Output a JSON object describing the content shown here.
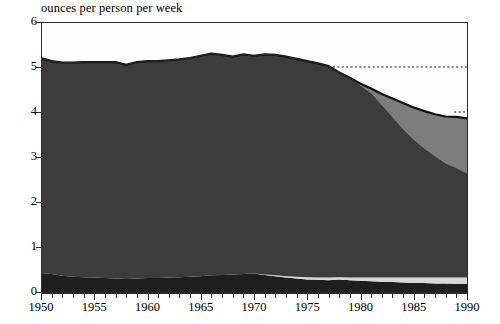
{
  "chart": {
    "title": "ounces per person per week",
    "axis_title_y": "ounces per person per week"
  },
  "axes": {
    "y_labels": [
      "6",
      "5",
      "4",
      "3",
      "2",
      "1",
      "0"
    ],
    "x_labels": [
      "1950",
      "1955",
      "1960",
      "1965",
      "1970",
      "1975",
      "1980",
      "1985",
      "1990"
    ]
  },
  "colors": {
    "series_bottom": "#1e1e1e",
    "series_thin_light": "#d8d8d8",
    "series_main": "#3c3c3c",
    "series_wedge": "#7d7d7d",
    "background": "#fdfdfd",
    "axis": "#2b2b2b",
    "outline": "#111111"
  },
  "chart_data": {
    "type": "area",
    "title": "ounces per person per week",
    "xlabel": "",
    "ylabel": "ounces per person per week",
    "xlim": [
      1950,
      1990
    ],
    "ylim": [
      0,
      6
    ],
    "grid": false,
    "legend": "none",
    "stacked": true,
    "x": [
      1950,
      1951,
      1952,
      1953,
      1954,
      1955,
      1956,
      1957,
      1958,
      1959,
      1960,
      1961,
      1962,
      1963,
      1964,
      1965,
      1966,
      1967,
      1968,
      1969,
      1970,
      1971,
      1972,
      1973,
      1974,
      1975,
      1976,
      1977,
      1978,
      1979,
      1980,
      1981,
      1982,
      1983,
      1984,
      1985,
      1986,
      1987,
      1988,
      1989,
      1990
    ],
    "series": [
      {
        "name": "bottom-dark-band",
        "values": [
          0.42,
          0.4,
          0.36,
          0.34,
          0.33,
          0.32,
          0.31,
          0.3,
          0.29,
          0.3,
          0.31,
          0.31,
          0.32,
          0.33,
          0.34,
          0.35,
          0.37,
          0.38,
          0.39,
          0.4,
          0.41,
          0.38,
          0.35,
          0.32,
          0.3,
          0.28,
          0.27,
          0.26,
          0.28,
          0.26,
          0.25,
          0.24,
          0.23,
          0.22,
          0.21,
          0.2,
          0.2,
          0.19,
          0.19,
          0.18,
          0.18
        ]
      },
      {
        "name": "thin-light-band",
        "values": [
          0.0,
          0.0,
          0.0,
          0.0,
          0.0,
          0.0,
          0.0,
          0.0,
          0.0,
          0.0,
          0.0,
          0.0,
          0.0,
          0.0,
          0.0,
          0.0,
          0.0,
          0.0,
          0.0,
          0.0,
          0.0,
          0.01,
          0.02,
          0.03,
          0.04,
          0.05,
          0.05,
          0.06,
          0.05,
          0.06,
          0.07,
          0.08,
          0.09,
          0.1,
          0.11,
          0.12,
          0.12,
          0.13,
          0.13,
          0.14,
          0.14
        ]
      },
      {
        "name": "main-dark-area",
        "values": [
          4.78,
          4.73,
          4.74,
          4.76,
          4.78,
          4.79,
          4.8,
          4.81,
          4.76,
          4.81,
          4.82,
          4.82,
          4.83,
          4.84,
          4.86,
          4.9,
          4.93,
          4.89,
          4.84,
          4.88,
          4.84,
          4.89,
          4.9,
          4.88,
          4.84,
          4.8,
          4.76,
          4.7,
          4.55,
          4.42,
          4.25,
          4.08,
          3.82,
          3.55,
          3.28,
          3.05,
          2.85,
          2.68,
          2.52,
          2.42,
          2.3
        ]
      },
      {
        "name": "grey-wedge",
        "values": [
          0.0,
          0.0,
          0.0,
          0.0,
          0.0,
          0.0,
          0.0,
          0.0,
          0.0,
          0.0,
          0.0,
          0.0,
          0.0,
          0.0,
          0.0,
          0.0,
          0.0,
          0.0,
          0.0,
          0.0,
          0.0,
          0.0,
          0.0,
          0.0,
          0.0,
          0.0,
          0.0,
          0.0,
          0.0,
          0.02,
          0.06,
          0.12,
          0.26,
          0.43,
          0.6,
          0.73,
          0.85,
          0.95,
          1.06,
          1.15,
          1.24
        ]
      }
    ],
    "series_totals": [
      5.2,
      5.13,
      5.1,
      5.1,
      5.11,
      5.11,
      5.11,
      5.11,
      5.05,
      5.11,
      5.13,
      5.13,
      5.15,
      5.17,
      5.2,
      5.25,
      5.3,
      5.27,
      5.23,
      5.28,
      5.25,
      5.28,
      5.27,
      5.23,
      5.18,
      5.13,
      5.08,
      5.02,
      4.88,
      4.76,
      4.63,
      4.52,
      4.4,
      4.3,
      4.2,
      4.1,
      4.02,
      3.95,
      3.9,
      3.89,
      3.86
    ],
    "reference_lines": [
      {
        "name": "dashed-line-5",
        "y": 5.0,
        "x_start": 1977,
        "x_end": 1990,
        "style": "dotted"
      },
      {
        "name": "dashed-line-4",
        "y": 4.0,
        "x_start": 1988.8,
        "x_end": 1990,
        "style": "dotted"
      }
    ]
  }
}
